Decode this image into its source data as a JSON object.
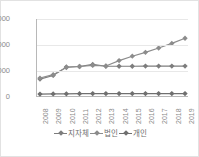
{
  "chart_data": {
    "type": "line",
    "title": "",
    "xlabel": "",
    "ylabel": "",
    "ylim": [
      0,
      3000
    ],
    "yticks": [
      0,
      1000,
      2000,
      3000
    ],
    "grid": true,
    "legend_position": "bottom",
    "categories": [
      "2008",
      "2009",
      "2010",
      "2011",
      "2012",
      "2013",
      "2014",
      "2015",
      "2016",
      "2017",
      "2018",
      "2019"
    ],
    "series": [
      {
        "name": "지자체",
        "color": "#7d7d7d",
        "values": [
          660,
          800,
          1130,
          1150,
          1230,
          1160,
          1160,
          1160,
          1165,
          1165,
          1165,
          1165
        ]
      },
      {
        "name": "법인",
        "color": "#8c8c8c",
        "values": [
          700,
          830,
          1110,
          1150,
          1190,
          1170,
          1380,
          1550,
          1700,
          1870,
          2050,
          2250
        ]
      },
      {
        "name": "개인",
        "color": "#6f6f6f",
        "values": [
          75,
          80,
          85,
          90,
          95,
          95,
          95,
          95,
          95,
          95,
          95,
          95
        ]
      }
    ]
  },
  "axis": {
    "ytick_labels": [
      "3000",
      "2000",
      "1000",
      "0"
    ],
    "xtick_labels": [
      "2008",
      "2009",
      "2010",
      "2011",
      "2012",
      "2013",
      "2014",
      "2015",
      "2016",
      "2017",
      "2018",
      "2019"
    ]
  },
  "legend": {
    "items": [
      {
        "label": "지자체",
        "color": "#7d7d7d"
      },
      {
        "label": "법인",
        "color": "#8c8c8c"
      },
      {
        "label": "개인",
        "color": "#6f6f6f"
      }
    ]
  }
}
